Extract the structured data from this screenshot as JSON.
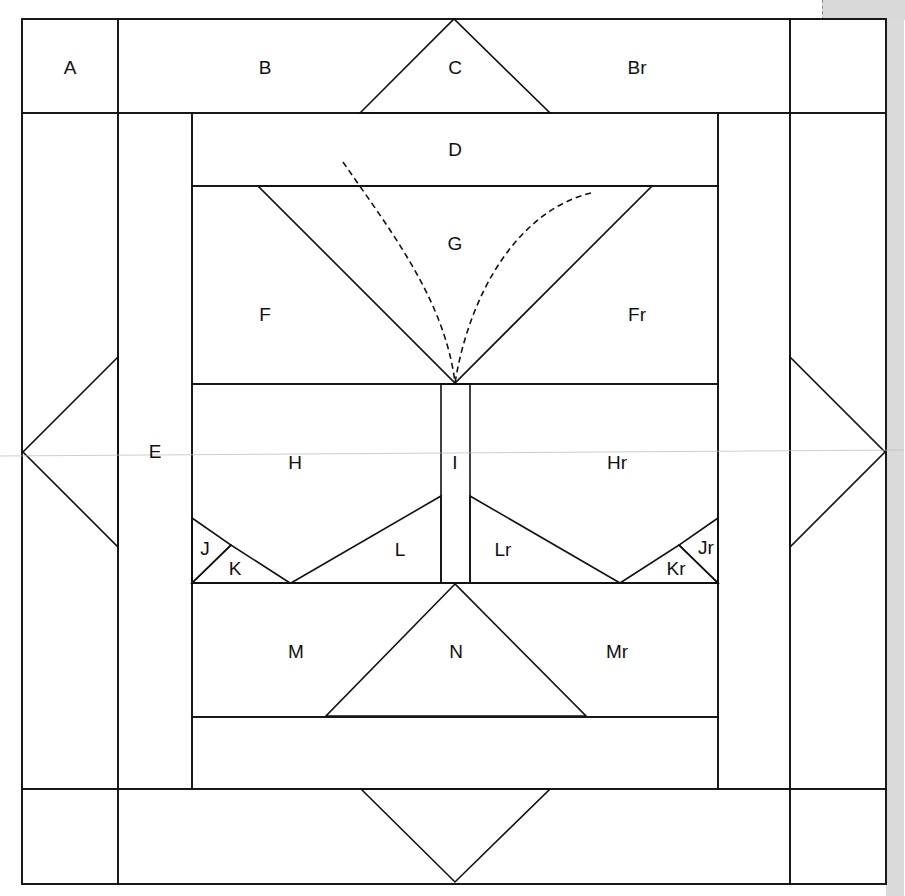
{
  "diagram": {
    "colors": {
      "white": "#ffffff",
      "border_fabric": "#adadad",
      "dark_fabric": "#959595",
      "floral_fabric": "#d6d6d6",
      "center_strip": "#c4c4c4",
      "seam": "#111111",
      "paper_edge": "#dadada"
    },
    "labels": {
      "A": "A",
      "B": "B",
      "C": "C",
      "Br": "Br",
      "D": "D",
      "E": "E",
      "F": "F",
      "Fr": "Fr",
      "G": "G",
      "H": "H",
      "I": "I",
      "Hr": "Hr",
      "J": "J",
      "K": "K",
      "L": "L",
      "Lr": "Lr",
      "Kr": "Kr",
      "Jr": "Jr",
      "M": "M",
      "N": "N",
      "Mr": "Mr"
    },
    "annotations": {
      "antennae": "dashed curved stitching lines (butterfly antennae) in piece G"
    }
  }
}
